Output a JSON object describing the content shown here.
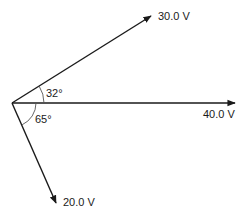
{
  "diagram": {
    "type": "phasor-diagram",
    "origin": [
      12,
      103
    ],
    "vectors": [
      {
        "name": "vector-30v",
        "label": "30.0 V",
        "magnitude": 30.0,
        "angle_deg": 32,
        "tip": [
          151,
          16
        ]
      },
      {
        "name": "vector-40v",
        "label": "40.0 V",
        "magnitude": 40.0,
        "angle_deg": 0,
        "tip": [
          235,
          103
        ]
      },
      {
        "name": "vector-20v",
        "label": "20.0 V",
        "magnitude": 20.0,
        "angle_deg": -65,
        "tip": [
          56,
          203
        ]
      }
    ],
    "angles": [
      {
        "label": "32°",
        "value": 32,
        "between": [
          "40.0 V",
          "30.0 V"
        ]
      },
      {
        "label": "65°",
        "value": 65,
        "between": [
          "40.0 V",
          "20.0 V"
        ]
      }
    ],
    "colors": {
      "line": "#1a1a1a",
      "background": "#ffffff"
    }
  }
}
